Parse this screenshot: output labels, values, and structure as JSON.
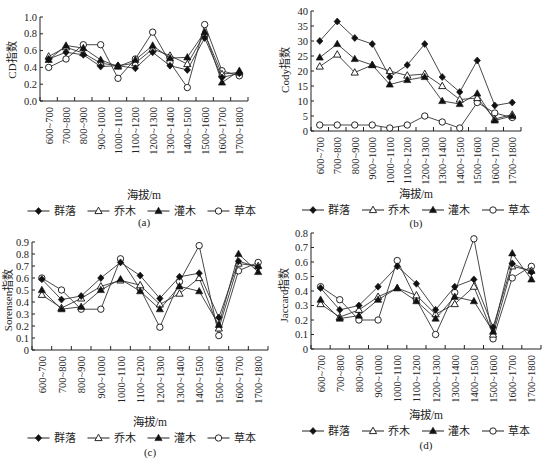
{
  "categories": [
    "600~700",
    "700~800",
    "800~900",
    "900~1000",
    "1000~1100",
    "1100~1200",
    "1200~1300",
    "1300~1400",
    "1400~1500",
    "1500~1600",
    "1600~1700",
    "1700~1800"
  ],
  "legend": [
    {
      "name": "群落",
      "marker": "filled-diamond"
    },
    {
      "name": "乔木",
      "marker": "open-triangle"
    },
    {
      "name": "灌木",
      "marker": "filled-triangle"
    },
    {
      "name": "草本",
      "marker": "open-circle"
    }
  ],
  "chart_data": [
    {
      "id": "a",
      "type": "line",
      "caption": "(a)",
      "title": "",
      "xlabel": "海拔/m",
      "ylabel": "CD指数",
      "ylim": [
        0,
        1.0
      ],
      "yticks": [
        "0.0",
        "0.2",
        "0.4",
        "0.6",
        "0.8",
        "1.0"
      ],
      "ytick_values": [
        0,
        0.2,
        0.4,
        0.6,
        0.8,
        1.0
      ],
      "grid": false,
      "legend_position": "bottom",
      "categories": [
        "600~700",
        "700~800",
        "800~900",
        "900~1000",
        "1000~1100",
        "1100~1200",
        "1200~1300",
        "1300~1400",
        "1400~1500",
        "1500~1600",
        "1600~1700",
        "1700~1800"
      ],
      "series": [
        {
          "name": "群落",
          "values": [
            0.5,
            0.58,
            0.55,
            0.41,
            0.42,
            0.39,
            0.58,
            0.42,
            0.37,
            0.75,
            0.28,
            0.33
          ]
        },
        {
          "name": "乔木",
          "values": [
            0.53,
            0.64,
            0.57,
            0.45,
            0.42,
            0.45,
            0.62,
            0.54,
            0.44,
            0.8,
            0.32,
            0.34
          ]
        },
        {
          "name": "灌木",
          "values": [
            0.49,
            0.66,
            0.63,
            0.49,
            0.41,
            0.49,
            0.66,
            0.51,
            0.52,
            0.82,
            0.22,
            0.36
          ]
        },
        {
          "name": "草本",
          "values": [
            0.4,
            0.5,
            0.67,
            0.67,
            0.27,
            0.5,
            0.82,
            0.46,
            0.16,
            0.91,
            0.36,
            0.3
          ]
        }
      ]
    },
    {
      "id": "b",
      "type": "line",
      "caption": "(b)",
      "title": "",
      "xlabel": "海拔/m",
      "ylabel": "Cody指数",
      "ylim": [
        0,
        40
      ],
      "yticks": [
        "0",
        "5",
        "10",
        "15",
        "20",
        "25",
        "30",
        "35",
        "40"
      ],
      "ytick_values": [
        0,
        5,
        10,
        15,
        20,
        25,
        30,
        35,
        40
      ],
      "grid": false,
      "legend_position": "bottom",
      "categories": [
        "600~700",
        "700~800",
        "800~900",
        "900~1000",
        "1000~1100",
        "1100~1200",
        "1200~1300",
        "1300~1400",
        "1400~1500",
        "1500~1600",
        "1600~1700",
        "1700~1800"
      ],
      "series": [
        {
          "name": "群落",
          "values": [
            30,
            36.5,
            31,
            29,
            18,
            22,
            29,
            18,
            13,
            23.5,
            8.5,
            9.5
          ]
        },
        {
          "name": "乔木",
          "values": [
            21.5,
            25.5,
            19.5,
            22,
            20,
            18.5,
            19,
            15,
            10.5,
            11,
            4,
            5.5
          ]
        },
        {
          "name": "灌木",
          "values": [
            24.5,
            29,
            24,
            22,
            15.5,
            17,
            18,
            10,
            9,
            12.5,
            3.5,
            5
          ]
        },
        {
          "name": "草本",
          "values": [
            2,
            2,
            2,
            2,
            1,
            2,
            5,
            3,
            1,
            9.5,
            6,
            4.5
          ]
        }
      ]
    },
    {
      "id": "c",
      "type": "line",
      "caption": "(c)",
      "title": "",
      "xlabel": "海拔/m",
      "ylabel": "Sorensen指数",
      "ylim": [
        0,
        0.9
      ],
      "yticks": [
        "0",
        "0.1",
        "0.2",
        "0.3",
        "0.4",
        "0.5",
        "0.6",
        "0.7",
        "0.8",
        "0.9"
      ],
      "ytick_values": [
        0,
        0.1,
        0.2,
        0.3,
        0.4,
        0.5,
        0.6,
        0.7,
        0.8,
        0.9
      ],
      "grid": false,
      "legend_position": "bottom",
      "categories": [
        "600~700",
        "700~800",
        "800~900",
        "900~1000",
        "1000~1100",
        "1100~1200",
        "1200~1300",
        "1300~1400",
        "1400~1500",
        "1500~1600",
        "1600~1700",
        "1700~1800"
      ],
      "series": [
        {
          "name": "群落",
          "values": [
            0.59,
            0.42,
            0.45,
            0.6,
            0.73,
            0.62,
            0.43,
            0.61,
            0.64,
            0.27,
            0.74,
            0.69
          ]
        },
        {
          "name": "乔木",
          "values": [
            0.46,
            0.35,
            0.43,
            0.53,
            0.58,
            0.54,
            0.38,
            0.47,
            0.6,
            0.18,
            0.72,
            0.7
          ]
        },
        {
          "name": "灌木",
          "values": [
            0.5,
            0.34,
            0.36,
            0.5,
            0.59,
            0.49,
            0.34,
            0.53,
            0.49,
            0.21,
            0.8,
            0.65
          ]
        },
        {
          "name": "草本",
          "values": [
            0.6,
            0.5,
            0.34,
            0.34,
            0.76,
            0.51,
            0.19,
            0.57,
            0.87,
            0.12,
            0.66,
            0.73
          ]
        }
      ]
    },
    {
      "id": "d",
      "type": "line",
      "caption": "(d)",
      "title": "",
      "xlabel": "海拔/m",
      "ylabel": "Jaccard指数",
      "ylim": [
        0,
        0.8
      ],
      "yticks": [
        "0",
        "0.1",
        "0.2",
        "0.3",
        "0.4",
        "0.5",
        "0.6",
        "0.7",
        "0.8"
      ],
      "ytick_values": [
        0,
        0.1,
        0.2,
        0.3,
        0.4,
        0.5,
        0.6,
        0.7,
        0.8
      ],
      "grid": false,
      "legend_position": "bottom",
      "categories": [
        "600~700",
        "700~800",
        "800~900",
        "900~1000",
        "1000~1100",
        "1100~1200",
        "1200~1300",
        "1300~1400",
        "1400~1500",
        "1500~1600",
        "1600~1700",
        "1700~1800"
      ],
      "series": [
        {
          "name": "群落",
          "values": [
            0.42,
            0.27,
            0.3,
            0.43,
            0.57,
            0.45,
            0.27,
            0.43,
            0.48,
            0.15,
            0.59,
            0.53
          ]
        },
        {
          "name": "乔木",
          "values": [
            0.31,
            0.22,
            0.27,
            0.36,
            0.42,
            0.37,
            0.24,
            0.31,
            0.43,
            0.1,
            0.57,
            0.54
          ]
        },
        {
          "name": "灌木",
          "values": [
            0.34,
            0.21,
            0.23,
            0.34,
            0.42,
            0.33,
            0.21,
            0.36,
            0.33,
            0.12,
            0.66,
            0.48
          ]
        },
        {
          "name": "草本",
          "values": [
            0.43,
            0.34,
            0.2,
            0.2,
            0.61,
            0.34,
            0.1,
            0.39,
            0.76,
            0.07,
            0.49,
            0.57
          ]
        }
      ]
    }
  ]
}
